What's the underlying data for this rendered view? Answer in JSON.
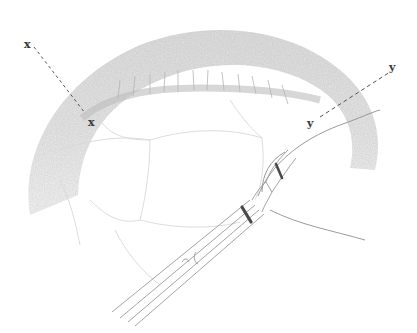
{
  "illustration": {
    "subject": "pencil sketch of curved anatomical wall with inserted catheter",
    "style": "graphite medical illustration",
    "colors": {
      "background": "#ffffff",
      "wall_shading": "#c9c9c9",
      "line": "#8a8a8a",
      "dark_band": "#4a4a4a",
      "label": "#3a3a3a"
    }
  },
  "section_lines": [
    {
      "id": "x",
      "start_label": "x",
      "end_label": "x"
    },
    {
      "id": "y",
      "start_label": "y",
      "end_label": "y"
    }
  ]
}
